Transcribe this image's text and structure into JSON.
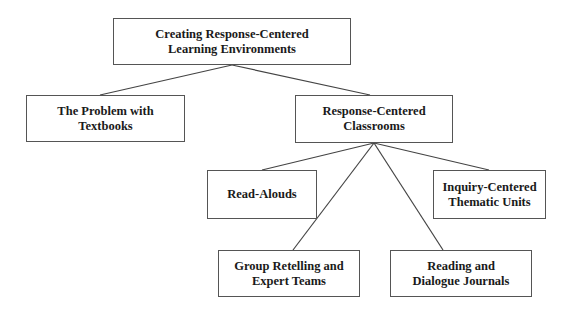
{
  "diagram": {
    "type": "hierarchy-tree",
    "colors": {
      "border": "#555555",
      "line": "#444444",
      "text": "#1a1a1a",
      "background": "#ffffff"
    },
    "nodes": [
      {
        "id": "root",
        "label": "Creating Response-Centered\nLearning Environments",
        "box": [
          113,
          18,
          238,
          47
        ]
      },
      {
        "id": "problem",
        "label": "The Problem with\nTextbooks",
        "box": [
          26,
          95,
          159,
          47
        ]
      },
      {
        "id": "classrooms",
        "label": "Response-Centered\nClassrooms",
        "box": [
          295,
          95,
          158,
          48
        ]
      },
      {
        "id": "readalouds",
        "label": "Read-Alouds",
        "box": [
          207,
          170,
          110,
          49
        ]
      },
      {
        "id": "inquiry",
        "label": "Inquiry-Centered\nThematic Units",
        "box": [
          433,
          170,
          113,
          49
        ]
      },
      {
        "id": "group",
        "label": "Group Retelling and\nExpert Teams",
        "box": [
          218,
          250,
          142,
          47
        ]
      },
      {
        "id": "journals",
        "label": "Reading and\nDialogue Journals",
        "box": [
          390,
          250,
          142,
          47
        ]
      }
    ],
    "edges": [
      {
        "from": "root",
        "to": "problem",
        "points": [
          232,
          65,
          100,
          95
        ]
      },
      {
        "from": "root",
        "to": "classrooms",
        "points": [
          232,
          65,
          370,
          95
        ]
      },
      {
        "from": "classrooms",
        "to": "readalouds",
        "points": [
          374,
          143,
          262,
          170
        ]
      },
      {
        "from": "classrooms",
        "to": "inquiry",
        "points": [
          374,
          143,
          489,
          170
        ]
      },
      {
        "from": "classrooms",
        "to": "group",
        "points": [
          374,
          143,
          293,
          250
        ]
      },
      {
        "from": "classrooms",
        "to": "journals",
        "points": [
          374,
          143,
          443,
          250
        ]
      }
    ]
  }
}
